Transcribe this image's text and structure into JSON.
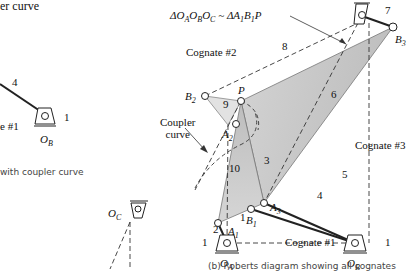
{
  "left_panel": {
    "title_fragment": "er curve",
    "link_label": "4",
    "ground_label": "1",
    "cognate_fragment": "e #1",
    "pivot_label": "O_B",
    "caption_fragment": "with coupler curve"
  },
  "main": {
    "relation": "ΔO_AO_BO_C ~ ΔA_1B_1P",
    "cognates": [
      "Cognate #1",
      "Cognate #2",
      "Cognate #3"
    ],
    "coupler_curve_label": "Coupler curve",
    "points": [
      "P",
      "B_2",
      "A_2",
      "A_3",
      "B_1",
      "A_1",
      "B_3",
      "O_A",
      "O_B",
      "O_C"
    ],
    "link_numbers": [
      "1",
      "2",
      "3",
      "4",
      "5",
      "6",
      "7",
      "8",
      "9",
      "10"
    ],
    "caption": "(b) Roberts diagram showing all cognates"
  },
  "colors": {
    "coupler_fill": "#c8c8c8",
    "coupler_fill_light": "#e0e0e0",
    "line": "#222222",
    "caption": "#444444"
  }
}
